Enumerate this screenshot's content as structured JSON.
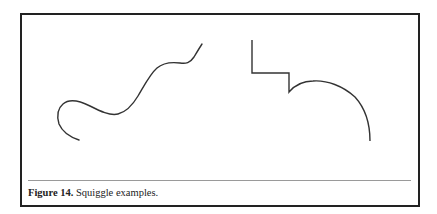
{
  "figure": {
    "caption_label": "Figure 14.",
    "caption_text": " Squiggle examples.",
    "stroke_color": "#333333",
    "shapes": [
      {
        "name": "freeform-squiggle",
        "type": "smooth-curve"
      },
      {
        "name": "step-and-arc",
        "type": "polyline-with-arc"
      }
    ]
  }
}
